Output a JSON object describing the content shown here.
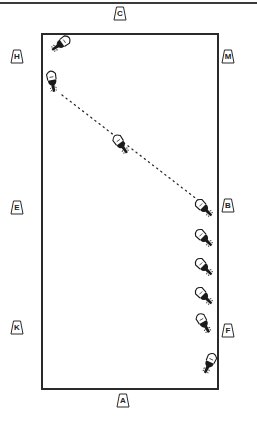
{
  "diagram": {
    "type": "dressage-arena",
    "colors": {
      "line": "#2a2a2a",
      "background": "#ffffff",
      "horse": "#1a1a1a"
    },
    "markers": [
      {
        "id": "C",
        "label": "C",
        "x": 120,
        "y": 13
      },
      {
        "id": "H",
        "label": "H",
        "x": 17,
        "y": 56
      },
      {
        "id": "M",
        "label": "M",
        "x": 228,
        "y": 56
      },
      {
        "id": "E",
        "label": "E",
        "x": 17,
        "y": 207
      },
      {
        "id": "B",
        "label": "B",
        "x": 228,
        "y": 205
      },
      {
        "id": "K",
        "label": "K",
        "x": 17,
        "y": 327
      },
      {
        "id": "F",
        "label": "F",
        "x": 228,
        "y": 330
      },
      {
        "id": "A",
        "label": "A",
        "x": 123,
        "y": 400
      }
    ],
    "path": {
      "style": "dotted",
      "from": [
        62,
        95
      ],
      "to": [
        198,
        200
      ]
    },
    "horses": [
      {
        "x": 62,
        "y": 43,
        "rotation": 235
      },
      {
        "x": 52,
        "y": 80,
        "rotation": 170
      },
      {
        "x": 120,
        "y": 143,
        "rotation": 145
      },
      {
        "x": 203,
        "y": 207,
        "rotation": 135
      },
      {
        "x": 203,
        "y": 237,
        "rotation": 135
      },
      {
        "x": 203,
        "y": 266,
        "rotation": 135
      },
      {
        "x": 203,
        "y": 295,
        "rotation": 135
      },
      {
        "x": 203,
        "y": 322,
        "rotation": 150
      },
      {
        "x": 210,
        "y": 362,
        "rotation": 205
      }
    ]
  }
}
